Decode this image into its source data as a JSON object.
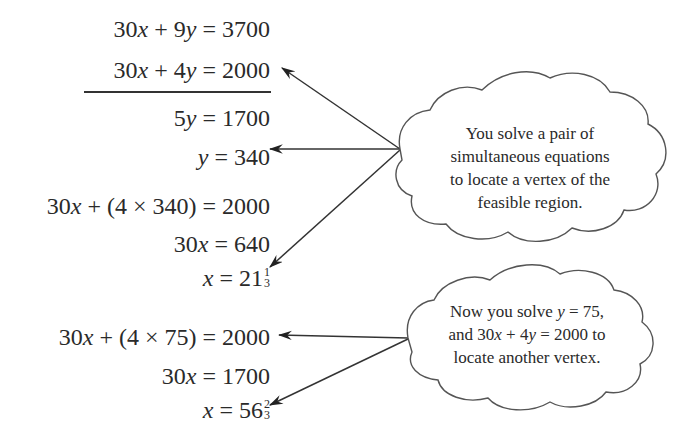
{
  "elimination": {
    "eq1": {
      "lhs": "30x + 9y",
      "rhs": "3700"
    },
    "eq2": {
      "lhs": "30x + 4y",
      "rhs": "2000"
    },
    "result1": {
      "lhs": "5y",
      "rhs": "1700"
    },
    "result2": {
      "lhs": "y",
      "rhs": "340"
    }
  },
  "substitution1": {
    "line1": {
      "lhs": "30x + (4 × 340)",
      "rhs": "2000"
    },
    "line2": {
      "lhs": "30x",
      "rhs": "640"
    },
    "line3": {
      "lhs": "x",
      "rhs_whole": "21",
      "rhs_num": "1",
      "rhs_den": "3"
    }
  },
  "substitution2": {
    "line1": {
      "lhs": "30x + (4 × 75)",
      "rhs": "2000"
    },
    "line2": {
      "lhs": "30x",
      "rhs": "1700"
    },
    "line3": {
      "lhs": "x",
      "rhs_whole": "56",
      "rhs_num": "2",
      "rhs_den": "3"
    }
  },
  "callouts": [
    {
      "lines": [
        "You solve a pair of",
        "simultaneous equations",
        "to locate a vertex of the",
        "feasible region."
      ]
    },
    {
      "lines": [
        "Now you solve y = 75,",
        "and 30x + 4y = 2000 to",
        "locate another vertex."
      ]
    }
  ],
  "colors": {
    "ink": "#2a2a2a",
    "background": "#ffffff"
  }
}
